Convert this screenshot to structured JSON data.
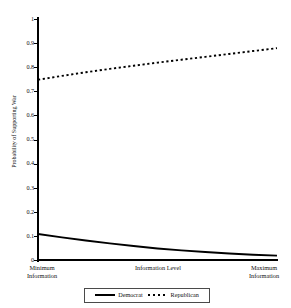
{
  "chart_data": {
    "type": "line",
    "title": "",
    "xlabel": "Information Level",
    "ylabel": "Probability of Supporting War",
    "xlim": [
      0,
      1
    ],
    "ylim": [
      0,
      1
    ],
    "grid": false,
    "legend_position": "bottom",
    "x_tick_labels": [
      "Minimum Information",
      "Information Level",
      "Maximum Information"
    ],
    "x_tick_label_min_line1": "Minimum",
    "x_tick_label_min_line2": "Information",
    "x_tick_label_mid": "Information Level",
    "x_tick_label_max_line1": "Maximum",
    "x_tick_label_max_line2": "Information",
    "y_tick_labels": [
      "1",
      "0.9",
      "0.8",
      "0.7",
      "0.6",
      "0.5",
      "0.4",
      "0.3",
      "0.2",
      "0.1",
      "0"
    ],
    "y_tick_values": [
      1,
      0.9,
      0.8,
      0.7,
      0.6,
      0.5,
      0.4,
      0.3,
      0.2,
      0.1,
      0
    ],
    "x": [
      0,
      0.1,
      0.2,
      0.3,
      0.4,
      0.5,
      0.6,
      0.7,
      0.8,
      0.9,
      1
    ],
    "series": [
      {
        "name": "Democrat",
        "style": "solid",
        "color": "#000000",
        "values": [
          0.108,
          0.094,
          0.081,
          0.069,
          0.058,
          0.048,
          0.04,
          0.033,
          0.027,
          0.022,
          0.018
        ]
      },
      {
        "name": "Republican",
        "style": "dotted",
        "color": "#000000",
        "values": [
          0.748,
          0.764,
          0.779,
          0.793,
          0.806,
          0.819,
          0.831,
          0.843,
          0.855,
          0.867,
          0.879
        ]
      }
    ]
  },
  "legend": {
    "entries": [
      {
        "label": "Democrat",
        "style": "solid"
      },
      {
        "label": "Republican",
        "style": "dotted"
      }
    ]
  },
  "axes": {
    "y_title": "Probability of Supporting War"
  }
}
